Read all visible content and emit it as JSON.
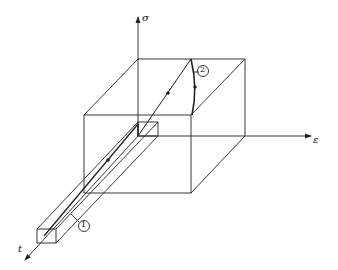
{
  "diagram": {
    "axes": {
      "sigma": "σ",
      "epsilon": "ε",
      "time": "t"
    },
    "markers": [
      {
        "id": "1",
        "label": "1"
      },
      {
        "id": "2",
        "label": "2"
      }
    ],
    "colors": {
      "line": "#222222",
      "background": "#ffffff"
    }
  }
}
